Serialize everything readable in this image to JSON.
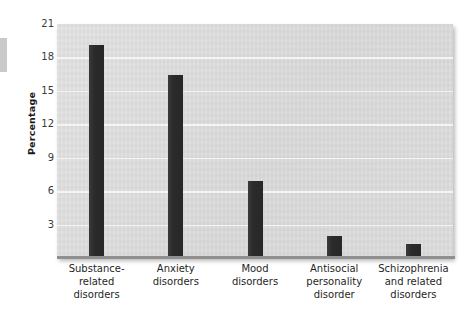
{
  "chart_data": {
    "type": "bar",
    "title": "",
    "xlabel": "",
    "ylabel": "Percentage",
    "categories": [
      "Substance-related disorders",
      "Anxiety disorders",
      "Mood disorders",
      "Antisocial personality disorder",
      "Schizophrenia and related disorders"
    ],
    "category_lines": [
      [
        "Substance-",
        "related",
        "disorders"
      ],
      [
        "Anxiety",
        "disorders"
      ],
      [
        "Mood",
        "disorders"
      ],
      [
        "Antisocial",
        "personality",
        "disorder"
      ],
      [
        "Schizophrenia",
        "and related",
        "disorders"
      ]
    ],
    "values": [
      19.1,
      16.4,
      6.9,
      2.0,
      1.3
    ],
    "ylim": [
      0,
      21
    ],
    "yticks": [
      21,
      18,
      15,
      12,
      9,
      6,
      3
    ],
    "ytick_labels": [
      "21",
      "18",
      "15",
      "12",
      "9",
      "6",
      "3"
    ],
    "grid": true,
    "legend": false,
    "colors": {
      "bar": "#2e2e2e",
      "plot_background": "#dedede",
      "gridline": "#f4f4f4",
      "axis": "#8f8f8f",
      "text": "#1f1f1f"
    }
  }
}
